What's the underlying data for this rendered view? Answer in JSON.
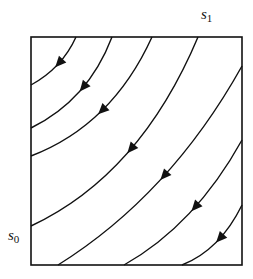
{
  "diagram": {
    "type": "phase-portrait / flow lines in square",
    "labels": {
      "top_right": {
        "base": "s",
        "sub": "1"
      },
      "left": {
        "base": "s",
        "sub": "0"
      }
    },
    "box": {
      "x": 31,
      "y": 37,
      "width": 211,
      "height": 228,
      "stroke": "#111111"
    },
    "curve_color": "#111111",
    "curves": [
      {
        "id": 1,
        "start": [
          76,
          37
        ],
        "ctrl": [
          62,
          68
        ],
        "end": [
          31,
          85
        ],
        "arrow": [
          58,
          63
        ],
        "arrow_dir": "down-left"
      },
      {
        "id": 2,
        "start": [
          112,
          37
        ],
        "ctrl": [
          88,
          100
        ],
        "end": [
          31,
          128
        ],
        "arrow": [
          82,
          87
        ],
        "arrow_dir": "down-left"
      },
      {
        "id": 3,
        "start": [
          152,
          37
        ],
        "ctrl": [
          112,
          125
        ],
        "end": [
          31,
          156
        ],
        "arrow": [
          100,
          110
        ],
        "arrow_dir": "down-left"
      },
      {
        "id": 4,
        "start": [
          198,
          37
        ],
        "ctrl": [
          140,
          175
        ],
        "end": [
          31,
          226
        ],
        "arrow": [
          128,
          146
        ],
        "arrow_dir": "down-left"
      },
      {
        "id": 5,
        "start": [
          242,
          66
        ],
        "ctrl": [
          170,
          195
        ],
        "end": [
          58,
          265
        ],
        "arrow": [
          160,
          173
        ],
        "arrow_dir": "down-left"
      },
      {
        "id": 6,
        "start": [
          242,
          140
        ],
        "ctrl": [
          195,
          225
        ],
        "end": [
          124,
          265
        ],
        "arrow": [
          187,
          201
        ],
        "arrow_dir": "down-left"
      },
      {
        "id": 7,
        "start": [
          242,
          205
        ],
        "ctrl": [
          220,
          250
        ],
        "end": [
          182,
          265
        ],
        "arrow": [
          217,
          236
        ],
        "arrow_dir": "down-left"
      }
    ]
  }
}
